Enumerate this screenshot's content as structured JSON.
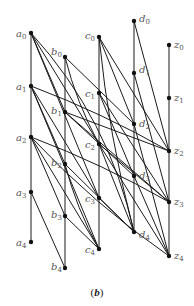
{
  "caption": "(b)",
  "caption_parts": {
    "open": "(",
    "letter": "b",
    "close": ")"
  },
  "diagram": {
    "nodes": [
      {
        "id": "a0",
        "base": "a",
        "sub": "0",
        "x": 31,
        "y": 33,
        "lx": 16,
        "ly": 37
      },
      {
        "id": "a1",
        "base": "a",
        "sub": "1",
        "x": 31,
        "y": 86,
        "lx": 16,
        "ly": 90
      },
      {
        "id": "a2",
        "base": "a",
        "sub": "2",
        "x": 31,
        "y": 137,
        "lx": 16,
        "ly": 141
      },
      {
        "id": "a3",
        "base": "a",
        "sub": "3",
        "x": 31,
        "y": 192,
        "lx": 16,
        "ly": 196
      },
      {
        "id": "a4",
        "base": "a",
        "sub": "4",
        "x": 31,
        "y": 242,
        "lx": 16,
        "ly": 246
      },
      {
        "id": "b0",
        "base": "b",
        "sub": "0",
        "x": 65,
        "y": 57,
        "lx": 51,
        "ly": 55
      },
      {
        "id": "b1",
        "base": "b",
        "sub": "1",
        "x": 65,
        "y": 112,
        "lx": 51,
        "ly": 114
      },
      {
        "id": "b2",
        "base": "b",
        "sub": "2",
        "x": 65,
        "y": 164,
        "lx": 51,
        "ly": 166
      },
      {
        "id": "b3",
        "base": "b",
        "sub": "3",
        "x": 65,
        "y": 216,
        "lx": 51,
        "ly": 218
      },
      {
        "id": "b4",
        "base": "b",
        "sub": "4",
        "x": 65,
        "y": 268,
        "lx": 51,
        "ly": 270
      },
      {
        "id": "c0",
        "base": "c",
        "sub": "0",
        "x": 99,
        "y": 37,
        "lx": 85,
        "ly": 39
      },
      {
        "id": "c1",
        "base": "c",
        "sub": "1",
        "x": 99,
        "y": 93,
        "lx": 85,
        "ly": 97
      },
      {
        "id": "c2",
        "base": "c",
        "sub": "2",
        "x": 99,
        "y": 144,
        "lx": 85,
        "ly": 148
      },
      {
        "id": "c3",
        "base": "c",
        "sub": "3",
        "x": 99,
        "y": 198,
        "lx": 85,
        "ly": 202
      },
      {
        "id": "c4",
        "base": "c",
        "sub": "4",
        "x": 99,
        "y": 249,
        "lx": 85,
        "ly": 253
      },
      {
        "id": "d0",
        "base": "d",
        "sub": "0",
        "x": 134,
        "y": 21,
        "lx": 139,
        "ly": 22
      },
      {
        "id": "d1",
        "base": "d",
        "sub": "1",
        "x": 134,
        "y": 73,
        "lx": 139,
        "ly": 73
      },
      {
        "id": "d2",
        "base": "d",
        "sub": "2",
        "x": 134,
        "y": 124,
        "lx": 139,
        "ly": 127
      },
      {
        "id": "d3",
        "base": "d",
        "sub": "3",
        "x": 134,
        "y": 176,
        "lx": 139,
        "ly": 179
      },
      {
        "id": "d4",
        "base": "d",
        "sub": "4",
        "x": 134,
        "y": 232,
        "lx": 139,
        "ly": 238
      },
      {
        "id": "z0",
        "base": "z",
        "sub": "0",
        "x": 169,
        "y": 45,
        "lx": 174,
        "ly": 48
      },
      {
        "id": "z1",
        "base": "z",
        "sub": "1",
        "x": 169,
        "y": 98,
        "lx": 174,
        "ly": 101
      },
      {
        "id": "z2",
        "base": "z",
        "sub": "2",
        "x": 169,
        "y": 151,
        "lx": 174,
        "ly": 154
      },
      {
        "id": "z3",
        "base": "z",
        "sub": "3",
        "x": 169,
        "y": 202,
        "lx": 174,
        "ly": 205
      },
      {
        "id": "z4",
        "base": "z",
        "sub": "4",
        "x": 169,
        "y": 256,
        "lx": 174,
        "ly": 259
      }
    ],
    "edges": [
      {
        "from": "a0",
        "to": "a4",
        "curve": 0
      },
      {
        "from": "b0",
        "to": "b4",
        "curve": 0
      },
      {
        "from": "c0",
        "to": "c4",
        "curve": 0
      },
      {
        "from": "d0",
        "to": "d4",
        "curve": 0
      },
      {
        "from": "z0",
        "to": "z4",
        "curve": 0
      },
      {
        "from": "a0",
        "to": "d4",
        "curve": -30
      },
      {
        "from": "a0",
        "to": "c2",
        "curve": 0
      },
      {
        "from": "a0",
        "to": "c3",
        "curve": 0
      },
      {
        "from": "a0",
        "to": "b1",
        "curve": 0
      },
      {
        "from": "a1",
        "to": "z2",
        "curve": -6
      },
      {
        "from": "a1",
        "to": "c3",
        "curve": 0
      },
      {
        "from": "a1",
        "to": "c4",
        "curve": 0
      },
      {
        "from": "a1",
        "to": "b2",
        "curve": 0
      },
      {
        "from": "a2",
        "to": "z3",
        "curve": -6
      },
      {
        "from": "a2",
        "to": "c4",
        "curve": 0
      },
      {
        "from": "a2",
        "to": "b3",
        "curve": 0
      },
      {
        "from": "a2",
        "to": "z4",
        "curve": 10
      },
      {
        "from": "a3",
        "to": "b4",
        "curve": 0
      },
      {
        "from": "b0",
        "to": "d2",
        "curve": 0
      },
      {
        "from": "b0",
        "to": "c2",
        "curve": 6
      },
      {
        "from": "b1",
        "to": "d3",
        "curve": 0
      },
      {
        "from": "b1",
        "to": "z3",
        "curve": 0
      },
      {
        "from": "b2",
        "to": "d4",
        "curve": 0
      },
      {
        "from": "b2",
        "to": "c4",
        "curve": 6
      },
      {
        "from": "b3",
        "to": "c4",
        "curve": 0
      },
      {
        "from": "c0",
        "to": "z2",
        "curve": 0
      },
      {
        "from": "c0",
        "to": "d4",
        "curve": 8
      },
      {
        "from": "c0",
        "to": "d2",
        "curve": 0
      },
      {
        "from": "c1",
        "to": "z3",
        "curve": 0
      },
      {
        "from": "c1",
        "to": "d3",
        "curve": 0
      },
      {
        "from": "c2",
        "to": "z4",
        "curve": 0
      },
      {
        "from": "c2",
        "to": "d4",
        "curve": 0
      },
      {
        "from": "c3",
        "to": "d4",
        "curve": 0
      },
      {
        "from": "d0",
        "to": "z2",
        "curve": 0
      },
      {
        "from": "d1",
        "to": "z3",
        "curve": 0
      },
      {
        "from": "d2",
        "to": "z4",
        "curve": 0
      },
      {
        "from": "d3",
        "to": "z4",
        "curve": 0
      },
      {
        "from": "b1",
        "to": "z2",
        "curve": 0
      },
      {
        "from": "c2",
        "to": "z3",
        "curve": 0
      }
    ]
  }
}
